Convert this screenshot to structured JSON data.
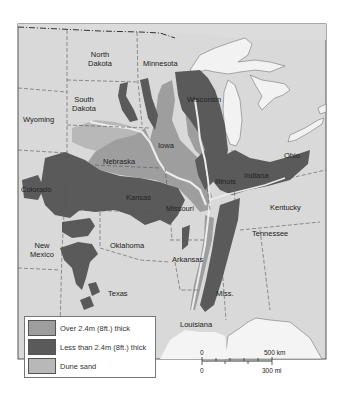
{
  "colors": {
    "land": "#d9d9d9",
    "water": "#f2f2f2",
    "loess_thick": "#9e9e9e",
    "loess_thin": "#5a5a5a",
    "dune_sand": "#b8b8b8",
    "border": "#555555"
  },
  "states": [
    {
      "name": "North\nDakota",
      "line1": "North",
      "line2": "Dakota"
    },
    {
      "name": "Minnesota"
    },
    {
      "name": "South Dakota",
      "line1": "South",
      "line2": "Dakota"
    },
    {
      "name": "Wyoming"
    },
    {
      "name": "Wisconsin"
    },
    {
      "name": "Iowa"
    },
    {
      "name": "Nebraska"
    },
    {
      "name": "Ohio"
    },
    {
      "name": "Illinois"
    },
    {
      "name": "Indiana"
    },
    {
      "name": "Colorado"
    },
    {
      "name": "Kansas"
    },
    {
      "name": "Missouri"
    },
    {
      "name": "Kentucky"
    },
    {
      "name": "Tennessee"
    },
    {
      "name": "New Mexico",
      "line1": "New",
      "line2": "Mexico"
    },
    {
      "name": "Oklahoma"
    },
    {
      "name": "Arkansas"
    },
    {
      "name": "Texas"
    },
    {
      "name": "Miss."
    },
    {
      "name": "Louisiana"
    }
  ],
  "legend": {
    "items": [
      {
        "label": "Over 2.4m (8ft.) thick",
        "color": "#9e9e9e"
      },
      {
        "label": "Less than 2.4m (8ft.) thick",
        "color": "#5a5a5a"
      },
      {
        "label": "Dune sand",
        "color": "#b8b8b8"
      }
    ]
  },
  "scale_bar": {
    "top_start": "0",
    "top_end": "500 km",
    "bottom_start": "0",
    "bottom_end": "300 mi"
  }
}
